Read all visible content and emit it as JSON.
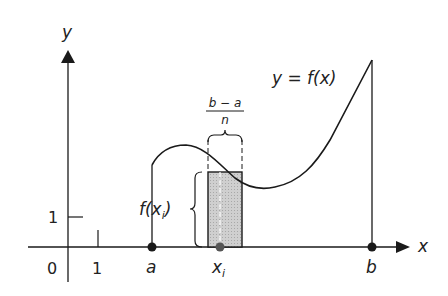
{
  "diagram": {
    "axes": {
      "x_label": "x",
      "y_label": "y",
      "origin_label": "0",
      "x_tick_label": "1",
      "y_tick_label": "1"
    },
    "curve_label": "y = f(x)",
    "points": {
      "a_label": "a",
      "b_label": "b",
      "xi_label": "x",
      "xi_subscript": "i"
    },
    "width_label": {
      "numerator": "b − a",
      "denominator": "n"
    },
    "height_label": {
      "prefix": "f(x",
      "subscript": "i",
      "suffix": ")"
    },
    "colors": {
      "ink": "#1a1a1a",
      "rect_fill": "#c8c8c8"
    }
  }
}
